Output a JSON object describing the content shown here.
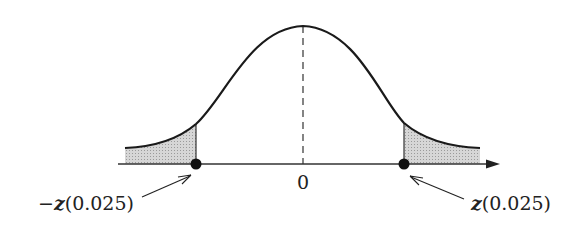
{
  "diagram": {
    "type": "standard normal density curve with two-tailed critical regions",
    "center_label": "0",
    "left_label_prefix": "−",
    "left_label_var": "z",
    "left_label_arg": "(0.025)",
    "right_label_var": "z",
    "right_label_arg": "(0.025)",
    "tail_area_each": 0.025,
    "colors": {
      "curve": "#1a1a1a",
      "shade": "#c8c8c8",
      "axis": "#333333",
      "background": "#ffffff"
    }
  }
}
